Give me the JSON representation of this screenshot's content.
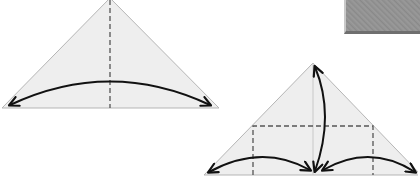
{
  "diagram": {
    "type": "origami-fold-steps",
    "colors": {
      "paper_fill": "#eeeeee",
      "paper_edge": "#b5b5b5",
      "crease_line": "#555555",
      "arrow": "#111111",
      "photo_gray": "#8f8f8f"
    },
    "steps": [
      {
        "name": "step-fold-in-half",
        "shape": "triangle",
        "creases": [
          "vertical-center-dashed"
        ],
        "arrows": [
          "curved-double-arrow-left-to-right"
        ]
      },
      {
        "name": "step-fold-corners-and-apex",
        "shape": "triangle",
        "creases": [
          "dashed-rectangle",
          "vertical-center-faint"
        ],
        "arrows": [
          "left-corner-to-center",
          "apex-to-center",
          "right-corner-to-center"
        ]
      }
    ],
    "photo_corner": "gray-paper-photo"
  }
}
